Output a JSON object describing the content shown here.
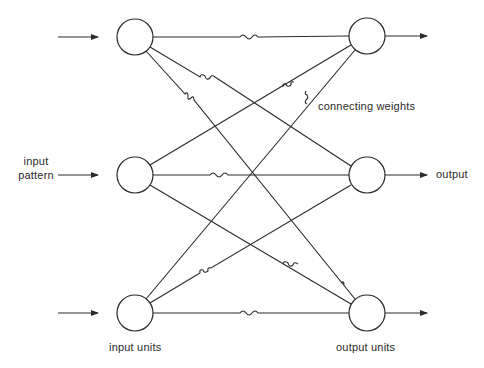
{
  "diagram": {
    "type": "two-layer pattern associator network",
    "stroke_color": "#2a2a2a",
    "background": "#ffffff",
    "input_units": [
      {
        "id": "in1",
        "cx": 135,
        "cy": 37
      },
      {
        "id": "in2",
        "cx": 135,
        "cy": 175
      },
      {
        "id": "in3",
        "cx": 135,
        "cy": 313
      }
    ],
    "output_units": [
      {
        "id": "out1",
        "cx": 367,
        "cy": 36
      },
      {
        "id": "out2",
        "cx": 367,
        "cy": 175
      },
      {
        "id": "out3",
        "cx": 367,
        "cy": 313
      }
    ],
    "unit_radius": 18,
    "connections": "all-to-all (each input unit connects to every output unit, 9 weights, each drawn with a small wavy segment)"
  },
  "labels": {
    "input_pattern_line1": "input",
    "input_pattern_line2": "pattern",
    "output": "output",
    "connecting_weights": "connecting weights",
    "input_units": "input units",
    "output_units": "output units"
  }
}
